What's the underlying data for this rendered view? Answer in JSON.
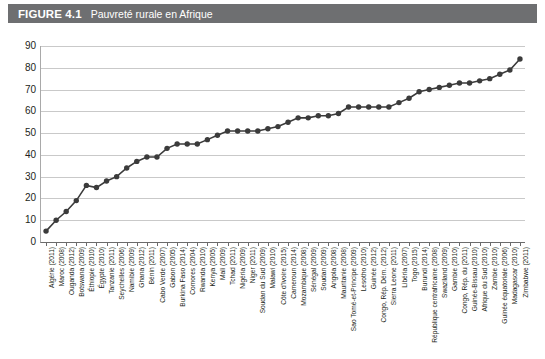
{
  "figure": {
    "number": "FIGURE 4.1",
    "title": "Pauvreté rurale en Afrique",
    "header_bg": "#6e6f71",
    "header_text_color": "#ffffff"
  },
  "source_note": "",
  "chart_data": {
    "type": "line",
    "title": "Pauvreté rurale en Afrique",
    "xlabel": "",
    "ylabel": "",
    "ylim": [
      0,
      90
    ],
    "yticks": [
      0,
      10,
      20,
      30,
      40,
      50,
      60,
      70,
      80,
      90
    ],
    "grid": true,
    "legend": "none",
    "marker": "circle",
    "series_color": "#3b3b3b",
    "categories": [
      "Algérie (2011)",
      "Maroc (2008)",
      "Ouganda (2012)",
      "Botswana (2009)",
      "Éthiopie (2010)",
      "Égypte (2010)",
      "Tanzanie (2011)",
      "Seychelles (2006)",
      "Namibie (2009)",
      "Ghana (2012)",
      "Bénin (2011)",
      "Cabo Verde (2007)",
      "Gabon (2005)",
      "Burkina Faso (2014)",
      "Comores (2004)",
      "Rwanda (2010)",
      "Kenya (2005)",
      "Mali (2009)",
      "Tchad (2011)",
      "Nigéria (2009)",
      "Niger (2011)",
      "Soudan du Sud (2009)",
      "Malawi (2010)",
      "Côte d'Ivoire (2015)",
      "Cameroun (2014)",
      "Mozambique (2008)",
      "Sénégal (2009)",
      "Soudan (2009)",
      "Angola (2008)",
      "Mauritanie (2008)",
      "Sao Tomé-et-Principe (2009)",
      "Lesotho (2010)",
      "Guinée (2012)",
      "Congo, Rép. Dém. (2012)",
      "Sierra Leone (2011)",
      "Libéria (2007)",
      "Togo (2015)",
      "Burundi (2014)",
      "République centrafricaine (2008)",
      "Swaziland (2009)",
      "Gambie (2010)",
      "Congo, Rép. du (2011)",
      "Guinée-Bissau (2010)",
      "Afrique du Sud (2010)",
      "Zambie (2010)",
      "Guinée équatoriale (2006)",
      "Madagascar (2010)",
      "Zimbabwe (2011)"
    ],
    "values": [
      5,
      10,
      14,
      19,
      26,
      25,
      28,
      30,
      34,
      37,
      39,
      39,
      43,
      45,
      45,
      45,
      47,
      49,
      51,
      51,
      51,
      51,
      52,
      53,
      55,
      57,
      57,
      58,
      58,
      59,
      62,
      62,
      62,
      62,
      62,
      64,
      66,
      69,
      70,
      71,
      72,
      73,
      73,
      74,
      75,
      77,
      79,
      84
    ]
  }
}
